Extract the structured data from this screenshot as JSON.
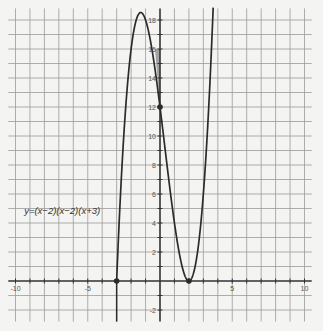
{
  "chart_data": {
    "type": "line",
    "title": "",
    "xlabel": "",
    "ylabel": "",
    "xlim": [
      -10.5,
      10.5
    ],
    "ylim": [
      -2.8,
      18.8
    ],
    "grid": true,
    "grid_step": 1,
    "x_tick_labels": [
      {
        "value": -10,
        "label": "-10"
      },
      {
        "value": -5,
        "label": "-5"
      },
      {
        "value": 5,
        "label": "5"
      },
      {
        "value": 10,
        "label": "10"
      }
    ],
    "y_tick_labels": [
      {
        "value": -2,
        "label": "-2"
      },
      {
        "value": 2,
        "label": "2"
      },
      {
        "value": 4,
        "label": "4"
      },
      {
        "value": 6,
        "label": "6"
      },
      {
        "value": 8,
        "label": "8"
      },
      {
        "value": 10,
        "label": "10"
      },
      {
        "value": 12,
        "label": "12"
      },
      {
        "value": 14,
        "label": "14"
      },
      {
        "value": 16,
        "label": "16"
      },
      {
        "value": 18,
        "label": "18"
      }
    ],
    "series": [
      {
        "name": "y=(x-2)(x-2)(x+3)",
        "function": "(x-2)*(x-2)*(x+3)",
        "domain": [
          -3,
          4
        ],
        "x": [
          -3,
          -2.5,
          -2,
          -1.5,
          -1.333,
          -1,
          -0.5,
          0,
          0.5,
          1,
          1.5,
          2,
          2.5,
          3,
          3.5,
          3.9
        ],
        "y": [
          0,
          10.125,
          16,
          18.375,
          18.52,
          18,
          15.625,
          12,
          7.875,
          4,
          1.125,
          0,
          1.375,
          6,
          14.625,
          25.99
        ]
      }
    ],
    "points": [
      {
        "x": -3,
        "y": 0,
        "label": "x-intercept"
      },
      {
        "x": 0,
        "y": 12,
        "label": "y-intercept"
      },
      {
        "x": 2,
        "y": 0,
        "label": "double root"
      }
    ],
    "shaded_region": {
      "vertices": [
        [
          -0.35,
          16
        ],
        [
          0,
          16
        ],
        [
          0,
          12
        ]
      ],
      "color": "#8a8a8a"
    },
    "vertical_line": {
      "x": -3
    },
    "annotations": [
      {
        "text": "y=(x−2)(x−2)(x+3)",
        "x": -9.4,
        "y": 4.6
      }
    ],
    "colors": {
      "curve": "#2b2b2b",
      "axis": "#333333",
      "grid": "#9a9a9a",
      "background": "#f4f4f2"
    }
  }
}
